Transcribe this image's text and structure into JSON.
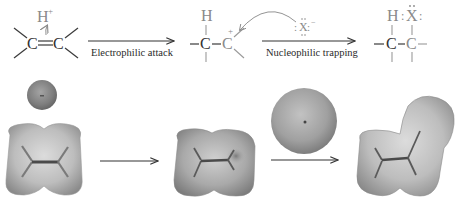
{
  "figure": {
    "type": "reaction-mechanism",
    "steps": [
      {
        "id": "reactant",
        "description": "alkene with approaching proton",
        "atoms": {
          "c1": "C",
          "c2": "C",
          "h_plus": "H",
          "h_charge": "+"
        }
      },
      {
        "id": "intermediate",
        "description": "carbocation",
        "atoms": {
          "c1": "C",
          "c2": "C",
          "h": "H",
          "charge": "+"
        }
      },
      {
        "id": "product",
        "description": "addition product",
        "atoms": {
          "c1": "C",
          "c2": "C",
          "h": "H",
          "x": "X",
          "x_lone_pairs_left": ":",
          "x_lone_pairs_right": ":"
        }
      }
    ],
    "arrows": [
      {
        "label": "Electrophilic attack"
      },
      {
        "label": "Nucleophilic trapping"
      }
    ],
    "nucleophile": {
      "symbol": "X",
      "charge": "−",
      "lone_pair_left": ":",
      "lone_pair_right": ":"
    },
    "potential_maps": {
      "description": "electrostatic potential surfaces",
      "items": [
        "proton",
        "alkene",
        "carbocation",
        "halide",
        "product"
      ]
    },
    "colors": {
      "surface_light": "#d6d6d6",
      "surface_mid": "#a8a8a8",
      "surface_dark": "#6e6e6e",
      "bond_stick": "#4a4a4a",
      "text": "#333333"
    }
  }
}
